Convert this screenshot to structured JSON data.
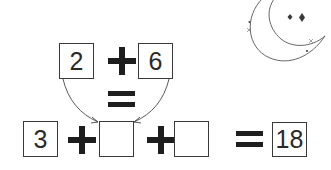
{
  "puzzle": {
    "top_row": {
      "left_value": "2",
      "operator": "+",
      "right_value": "6",
      "result_operator": "="
    },
    "bottom_row": {
      "first_value": "3",
      "operator_1": "+",
      "blank_1": "",
      "operator_2": "+",
      "blank_2": "",
      "equals": "=",
      "result": "18"
    },
    "arrows": [
      {
        "from": "top-left-box",
        "to": "bottom-blank-1"
      },
      {
        "from": "top-right-box",
        "to": "bottom-blank-1"
      }
    ]
  },
  "decoration": {
    "icon": "crescent-moon-with-stars",
    "stroke_color": "#555555"
  }
}
